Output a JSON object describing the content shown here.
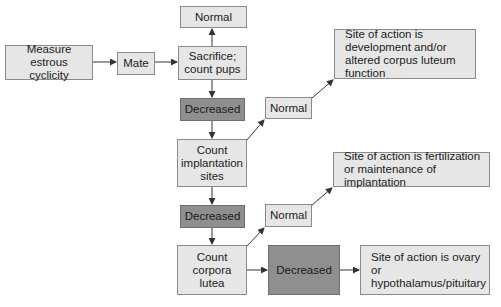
{
  "diagram": {
    "type": "flowchart",
    "colors": {
      "light_box": "#e6e6e6",
      "dark_box": "#8f8f8f",
      "border": "#8a8a8a",
      "arrow": "#333333"
    },
    "nodes": {
      "measure": "Measure estrous cyclicity",
      "mate": "Mate",
      "normal_top": "Normal",
      "sacrifice": "Sacrifice; count pups",
      "decreased_1": "Decreased",
      "count_implantation": "Count implantation sites",
      "normal_mid": "Normal",
      "site_1": "Site of action is development and/or altered corpus luteum function",
      "decreased_2": "Decreased",
      "count_corpora": "Count corpora lutea",
      "normal_low": "Normal",
      "site_2": "Site of action is fertilization or maintenance of implantation",
      "decreased_3": "Decreased",
      "site_3": "Site of action is ovary or hypothalamus/pituitary"
    },
    "edges": [
      [
        "measure",
        "mate"
      ],
      [
        "mate",
        "sacrifice"
      ],
      [
        "sacrifice",
        "normal_top"
      ],
      [
        "sacrifice",
        "decreased_1"
      ],
      [
        "decreased_1",
        "count_implantation"
      ],
      [
        "count_implantation",
        "normal_mid"
      ],
      [
        "normal_mid",
        "site_1"
      ],
      [
        "count_implantation",
        "decreased_2"
      ],
      [
        "decreased_2",
        "count_corpora"
      ],
      [
        "count_corpora",
        "normal_low"
      ],
      [
        "normal_low",
        "site_2"
      ],
      [
        "count_corpora",
        "decreased_3"
      ],
      [
        "decreased_3",
        "site_3"
      ]
    ]
  }
}
